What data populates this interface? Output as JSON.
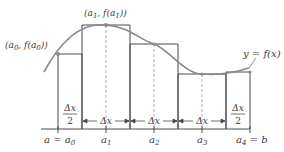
{
  "diagram": {
    "curve_label": "y = f(x)",
    "point_labels": [
      {
        "text": "(a",
        "sub": "0",
        "mid": ", f(a",
        "sub2": "0",
        "end": "))"
      },
      {
        "text": "(a",
        "sub": "1",
        "mid": ", f(a",
        "sub2": "1",
        "end": "))"
      }
    ],
    "axis_labels": {
      "a0": {
        "left": "a = a",
        "sub": "0"
      },
      "a1": {
        "base": "a",
        "sub": "1"
      },
      "a2": {
        "base": "a",
        "sub": "2"
      },
      "a3": {
        "base": "a",
        "sub": "3"
      },
      "a4": {
        "left": "a",
        "sub": "4",
        "right": " = b"
      }
    },
    "interval_labels": {
      "half_num": "Δx",
      "half_den": "2",
      "full": "Δx"
    },
    "colors": {
      "curve": "#8a8a8a",
      "rect_stroke": "#4a4a4a",
      "dashed": "#b0b0b0",
      "point": "#8a8a8a",
      "text": "#3a3a3a"
    },
    "geometry": {
      "baseline_y": 129,
      "x_axis": [
        41,
        250
      ],
      "partitions_x": [
        58,
        106,
        154,
        202,
        250
      ],
      "rect_edges_x": [
        58,
        82,
        130,
        178,
        226,
        250
      ],
      "rect_tops_y": [
        54,
        25,
        44,
        74,
        74
      ]
    }
  }
}
